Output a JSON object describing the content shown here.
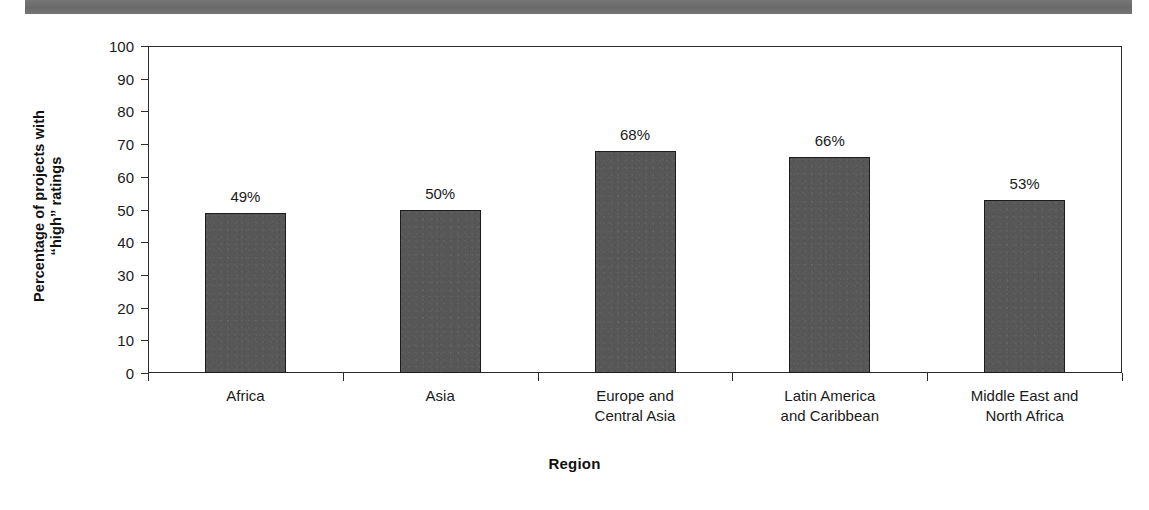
{
  "decoration": {
    "top_band_color": "#6e6e6e"
  },
  "chart_data": {
    "type": "bar",
    "title": "",
    "xlabel": "Region",
    "ylabel_line1": "Percentage of projects with",
    "ylabel_line2": "“high” ratings",
    "categories": [
      "Africa",
      "Europe and Central Asia",
      "Asia",
      "Latin America and Caribbean",
      "Middle East and North Africa"
    ],
    "category_lines": [
      [
        "Africa"
      ],
      [
        "Asia"
      ],
      [
        "Europe and",
        "Central Asia"
      ],
      [
        "Latin America",
        "and Caribbean"
      ],
      [
        "Middle East and",
        "North Africa"
      ]
    ],
    "values": [
      49,
      50,
      68,
      66,
      53
    ],
    "value_labels": [
      "49%",
      "50%",
      "68%",
      "66%",
      "53%"
    ],
    "ylim": [
      0,
      100
    ],
    "ytick_labels": [
      "0",
      "10",
      "20",
      "30",
      "40",
      "50",
      "60",
      "70",
      "80",
      "90",
      "100"
    ],
    "ytick_values": [
      0,
      10,
      20,
      30,
      40,
      50,
      60,
      70,
      80,
      90,
      100
    ],
    "grid": false,
    "legend": false,
    "bar_color": "#575757",
    "bar_border_color": "#1c1c1c",
    "axis_color": "#2b2b2b"
  }
}
